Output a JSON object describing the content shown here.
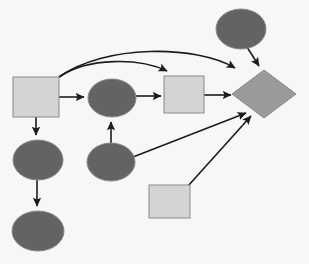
{
  "diagram": {
    "background_color": "#f7f7f5",
    "width": 309,
    "height": 264,
    "palette": {
      "square_fill": "#d4d4d4",
      "ellipse_fill": "#636363",
      "diamond_fill": "#9a9a9a",
      "node_stroke": "#8a8a8a",
      "edge_stroke": "#1c1c1c"
    },
    "nodes": [
      {
        "id": "square-1",
        "shape": "square",
        "label": "",
        "fill": "#d4d4d4",
        "x": 13,
        "y": 77,
        "width": 46,
        "height": 40
      },
      {
        "id": "ellipse-1",
        "shape": "ellipse",
        "label": "",
        "fill": "#636363",
        "cx": 38,
        "cy": 160,
        "rx": 25,
        "ry": 20
      },
      {
        "id": "ellipse-2",
        "shape": "ellipse",
        "label": "",
        "fill": "#636363",
        "cx": 38,
        "cy": 231,
        "rx": 26,
        "ry": 20
      },
      {
        "id": "ellipse-3",
        "shape": "ellipse",
        "label": "",
        "fill": "#636363",
        "cx": 112,
        "cy": 98,
        "rx": 24,
        "ry": 19
      },
      {
        "id": "ellipse-4",
        "shape": "ellipse",
        "label": "",
        "fill": "#636363",
        "cx": 111,
        "cy": 162,
        "rx": 24,
        "ry": 19
      },
      {
        "id": "square-2",
        "shape": "square",
        "label": "",
        "fill": "#d4d4d4",
        "x": 164,
        "y": 76,
        "width": 40,
        "height": 37
      },
      {
        "id": "ellipse-5",
        "shape": "ellipse",
        "label": "",
        "fill": "#636363",
        "cx": 241,
        "cy": 29,
        "rx": 25,
        "ry": 20
      },
      {
        "id": "diamond-1",
        "shape": "diamond",
        "label": "",
        "fill": "#9a9a9a",
        "cx": 264,
        "cy": 94,
        "rx": 32,
        "ry": 24
      },
      {
        "id": "square-3",
        "shape": "square",
        "label": "",
        "fill": "#d4d4d4",
        "x": 149,
        "y": 185,
        "width": 41,
        "height": 33
      }
    ],
    "edges": [
      {
        "id": "edge-s1-e3",
        "from": "square-1",
        "to": "ellipse-3",
        "style": "straight",
        "arrow": true
      },
      {
        "id": "edge-s1-s2",
        "from": "square-1",
        "to": "square-2",
        "style": "curved",
        "arrow": true
      },
      {
        "id": "edge-s1-d1",
        "from": "square-1",
        "to": "diamond-1",
        "style": "curved",
        "arrow": true
      },
      {
        "id": "edge-s1-e1",
        "from": "square-1",
        "to": "ellipse-1",
        "style": "straight",
        "arrow": true
      },
      {
        "id": "edge-e1-e2",
        "from": "ellipse-1",
        "to": "ellipse-2",
        "style": "straight",
        "arrow": true
      },
      {
        "id": "edge-e3-s2",
        "from": "ellipse-3",
        "to": "square-2",
        "style": "straight",
        "arrow": true
      },
      {
        "id": "edge-e4-e3",
        "from": "ellipse-4",
        "to": "ellipse-3",
        "style": "straight",
        "arrow": true
      },
      {
        "id": "edge-s2-d1",
        "from": "square-2",
        "to": "diamond-1",
        "style": "straight",
        "arrow": true
      },
      {
        "id": "edge-e4-d1",
        "from": "ellipse-4",
        "to": "diamond-1",
        "style": "straight",
        "arrow": true
      },
      {
        "id": "edge-s3-d1",
        "from": "square-3",
        "to": "diamond-1",
        "style": "straight",
        "arrow": true
      },
      {
        "id": "edge-e5-d1",
        "from": "ellipse-5",
        "to": "diamond-1",
        "style": "straight",
        "arrow": true
      }
    ]
  }
}
